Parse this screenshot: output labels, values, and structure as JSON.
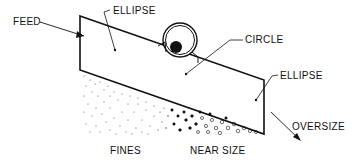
{
  "diagram": {
    "labels": {
      "feed": "FEED",
      "ellipse_top": "ELLIPSE",
      "circle": "CIRCLE",
      "ellipse_right": "ELLIPSE",
      "oversize": "OVERSIZE",
      "fines": "FINES",
      "near_size": "NEAR SIZE"
    },
    "colors": {
      "stroke": "#111111",
      "background": "#ffffff"
    }
  }
}
